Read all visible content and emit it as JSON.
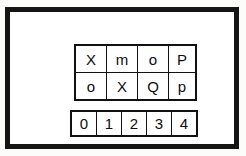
{
  "figure": {
    "frame": {
      "name": "outer-frame",
      "border_color": "#151515",
      "fill_color": "#ffffff",
      "border_width_px": 5
    },
    "canvas_background": "#fcfcfa",
    "text_color": "#0d0d0d",
    "grid_line_color": "#111111"
  },
  "letter_grid": {
    "name": "letter-grid",
    "rows": 2,
    "columns": 4,
    "cells": [
      [
        "X",
        "m",
        "o",
        "P"
      ],
      [
        "o",
        "X",
        "Q",
        "p"
      ]
    ]
  },
  "digit_strip": {
    "name": "digit-strip",
    "rows": 1,
    "columns": 5,
    "cells": [
      [
        "0",
        "1",
        "2",
        "3",
        "4"
      ]
    ]
  }
}
